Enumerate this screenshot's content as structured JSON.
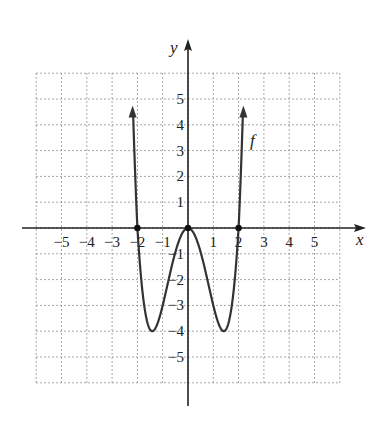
{
  "chart_data": {
    "type": "line",
    "title": "",
    "function_label": "f",
    "xlabel": "x",
    "ylabel": "y",
    "xlim": [
      -6,
      6
    ],
    "ylim": [
      -6,
      6
    ],
    "grid": true,
    "grid_style": "dotted",
    "x_ticks": [
      "−5",
      "−4",
      "−3",
      "−2",
      "−1",
      "1",
      "2",
      "3",
      "4",
      "5"
    ],
    "x_tick_values": [
      -5,
      -4,
      -3,
      -2,
      -1,
      1,
      2,
      3,
      4,
      5
    ],
    "y_ticks": [
      "5",
      "4",
      "3",
      "2",
      "1",
      "−1",
      "−2",
      "−3",
      "−4",
      "−5"
    ],
    "y_tick_values": [
      5,
      4,
      3,
      2,
      1,
      -1,
      -2,
      -3,
      -4,
      -5
    ],
    "series": [
      {
        "name": "f",
        "expression": "x^4 - 4x^2",
        "x": [
          -2.17,
          -2,
          -1.75,
          -1.5,
          -1.414,
          -1.25,
          -1,
          -0.75,
          -0.5,
          -0.25,
          0,
          0.25,
          0.5,
          0.75,
          1,
          1.25,
          1.414,
          1.5,
          1.75,
          2,
          2.17
        ],
        "y": [
          3.3,
          0,
          -2.87,
          -3.94,
          -4,
          -3.81,
          -3,
          -1.93,
          -0.94,
          -0.25,
          0,
          -0.25,
          -0.94,
          -1.93,
          -3,
          -3.81,
          -4,
          -3.94,
          -2.87,
          0,
          3.3
        ],
        "end_arrows": true
      }
    ],
    "marked_points": [
      {
        "x": -2,
        "y": 0
      },
      {
        "x": 0,
        "y": 0
      },
      {
        "x": 2,
        "y": 0
      }
    ],
    "minima": [
      {
        "x": -1.414,
        "y": -4
      },
      {
        "x": 1.414,
        "y": -4
      }
    ]
  },
  "labels": {
    "x_axis": "x",
    "y_axis": "y",
    "function": "f"
  }
}
